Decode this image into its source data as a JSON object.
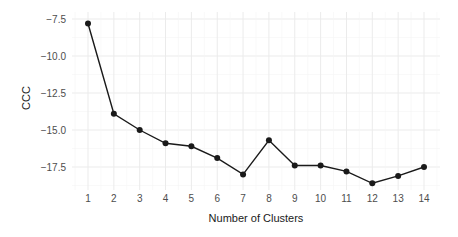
{
  "chart_data": {
    "type": "line",
    "title": "",
    "xlabel": "Number of Clusters",
    "ylabel": "CCC",
    "x": [
      1,
      2,
      3,
      4,
      5,
      6,
      7,
      8,
      9,
      10,
      11,
      12,
      13,
      14
    ],
    "series": [
      {
        "name": "CCC",
        "values": [
          -7.8,
          -13.9,
          -15.0,
          -15.9,
          -16.1,
          -16.9,
          -18.0,
          -15.7,
          -17.4,
          -17.4,
          -17.8,
          -18.6,
          -18.1,
          -17.5
        ],
        "color": "#1a1a1a",
        "marker": "circle"
      }
    ],
    "x_ticks": [
      "1",
      "2",
      "3",
      "4",
      "5",
      "6",
      "7",
      "8",
      "9",
      "10",
      "11",
      "12",
      "13",
      "14"
    ],
    "y_ticks": [
      -7.5,
      -10.0,
      -12.5,
      -15.0,
      -17.5
    ],
    "y_tick_labels": [
      "−7.5",
      "−10.0",
      "−12.5",
      "−15.0",
      "−17.5"
    ],
    "ylim": [
      -19.0,
      -7.2
    ],
    "xlim": [
      0.4,
      14.6
    ],
    "grid": true,
    "legend": "none",
    "theme": "minimal"
  }
}
